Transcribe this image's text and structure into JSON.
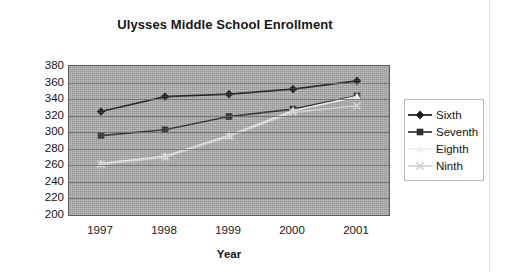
{
  "chart_data": {
    "type": "line",
    "title": "Ulysses Middle School Enrollment",
    "xlabel": "Year",
    "ylabel": "",
    "categories": [
      "1997",
      "1998",
      "1999",
      "2000",
      "2001"
    ],
    "x": [
      1997,
      1998,
      1999,
      2000,
      2001
    ],
    "ylim": [
      200,
      380
    ],
    "yticks": [
      380,
      360,
      340,
      320,
      300,
      280,
      260,
      240,
      220,
      200
    ],
    "grid": true,
    "legend_position": "right",
    "series": [
      {
        "name": "Sixth",
        "marker": "diamond",
        "color": "#1a1a1a",
        "values": [
          325,
          343,
          346,
          352,
          362
        ]
      },
      {
        "name": "Seventh",
        "marker": "square",
        "color": "#2e2e2e",
        "values": [
          296,
          303,
          319,
          328,
          344
        ]
      },
      {
        "name": "Eighth",
        "marker": "triangle",
        "color": "#f0f0f0",
        "values": [
          262,
          271,
          296,
          326,
          343
        ]
      },
      {
        "name": "Ninth",
        "marker": "x",
        "color": "#d2d2d2",
        "values": [
          261,
          270,
          295,
          324,
          332
        ]
      }
    ]
  },
  "legend": {
    "items": [
      {
        "label": "Sixth"
      },
      {
        "label": "Seventh"
      },
      {
        "label": "Eighth"
      },
      {
        "label": "Ninth"
      }
    ]
  },
  "colors": {
    "plot_background": "#a8a8a8",
    "plot_border": "#5a5a5a",
    "gridline": "#6f6f6f",
    "page_background": "#ffffff",
    "text": "#161616"
  }
}
